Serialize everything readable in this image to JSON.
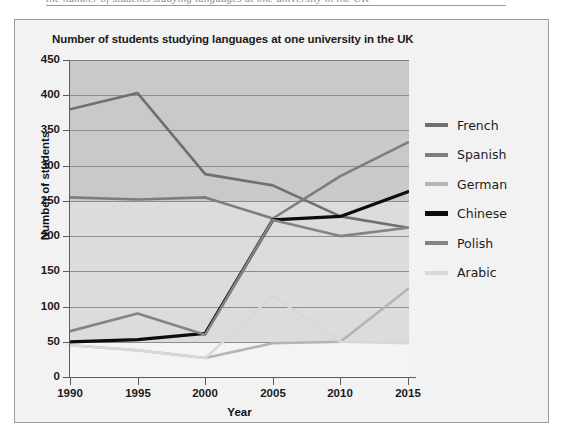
{
  "page": {
    "top_fragment": "the number of students studying languages at one university in the UK"
  },
  "figure": {
    "title": "Number of students studying languages at one university in the UK"
  },
  "legend": {
    "position": "right",
    "items": [
      {
        "label": "French",
        "color": "#6f6f6f"
      },
      {
        "label": "Spanish",
        "color": "#7d7d7d"
      },
      {
        "label": "German",
        "color": "#b4b4b4"
      },
      {
        "label": "Chinese",
        "color": "#0d0d0d"
      },
      {
        "label": "Polish",
        "color": "#848484"
      },
      {
        "label": "Arabic",
        "color": "#d8d8d8"
      }
    ]
  },
  "chart_data": {
    "type": "line",
    "title": "Number of students studying languages at one university in the UK",
    "xlabel": "Year",
    "ylabel": "Number of students",
    "categories": [
      "1990",
      "1995",
      "2000",
      "2005",
      "2010",
      "2015"
    ],
    "x": [
      1990,
      1995,
      2000,
      2005,
      2010,
      2015
    ],
    "xlim": [
      1990,
      2015
    ],
    "ylim": [
      0,
      450
    ],
    "yticks": [
      0,
      50,
      100,
      150,
      200,
      250,
      300,
      350,
      400,
      450
    ],
    "ytick_labels": [
      "0",
      "50",
      "100",
      "150",
      "200",
      "250",
      "300",
      "350",
      "400",
      "450"
    ],
    "grid": "horizontal",
    "legend_position": "right",
    "series": [
      {
        "name": "French",
        "color": "#6f6f6f",
        "values": [
          380,
          403,
          288,
          272,
          228,
          212
        ]
      },
      {
        "name": "Spanish",
        "color": "#7d7d7d",
        "values": [
          255,
          252,
          255,
          225,
          285,
          333
        ]
      },
      {
        "name": "German",
        "color": "#b4b4b4",
        "values": [
          45,
          38,
          27,
          48,
          50,
          125
        ]
      },
      {
        "name": "Chinese",
        "color": "#0d0d0d",
        "values": [
          50,
          53,
          62,
          223,
          228,
          263
        ]
      },
      {
        "name": "Polish",
        "color": "#848484",
        "values": [
          65,
          90,
          60,
          223,
          200,
          212
        ]
      },
      {
        "name": "Arabic",
        "color": "#d8d8d8",
        "values": [
          45,
          38,
          27,
          115,
          50,
          48
        ]
      }
    ]
  }
}
